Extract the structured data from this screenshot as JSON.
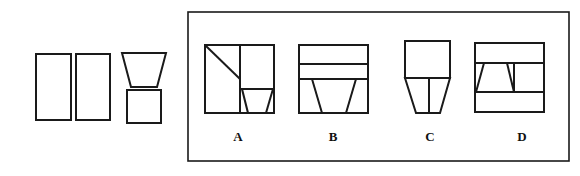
{
  "stroke_color": "#1a1a1a",
  "question_figure": {
    "parts": [
      {
        "name": "tall-rectangle-1",
        "shape": "rect",
        "x": 36,
        "y": 54,
        "w": 35,
        "h": 66
      },
      {
        "name": "tall-rectangle-2",
        "shape": "rect",
        "x": 76,
        "y": 54,
        "w": 34,
        "h": 66
      },
      {
        "name": "inverted-trapezoid",
        "shape": "polygon",
        "points": "122,53 166,53 157,87 131,87"
      },
      {
        "name": "small-square",
        "shape": "rect",
        "x": 127,
        "y": 90,
        "w": 34,
        "h": 33
      }
    ]
  },
  "options_frame": {
    "x": 188,
    "y": 12,
    "w": 381,
    "h": 149
  },
  "options": [
    {
      "label": "A",
      "label_x": 238,
      "label_y": 129
    },
    {
      "label": "B",
      "label_x": 333,
      "label_y": 129
    },
    {
      "label": "C",
      "label_x": 430,
      "label_y": 129
    },
    {
      "label": "D",
      "label_x": 522,
      "label_y": 129
    }
  ]
}
